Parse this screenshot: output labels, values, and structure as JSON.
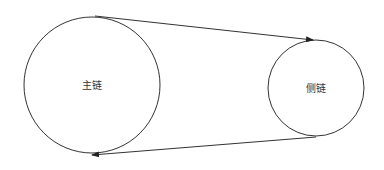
{
  "diagram": {
    "nodes": [
      {
        "id": "main-chain",
        "label": "主链",
        "cx": 92,
        "cy": 85,
        "r": 68
      },
      {
        "id": "side-chain",
        "label": "侧链",
        "cx": 316,
        "cy": 88,
        "r": 48
      }
    ],
    "edges": [
      {
        "from": "main-chain",
        "to": "side-chain",
        "x1": 95,
        "y1": 16,
        "x2": 313,
        "y2": 40
      },
      {
        "from": "side-chain",
        "to": "main-chain",
        "x1": 316,
        "y1": 137,
        "x2": 92,
        "y2": 155
      }
    ],
    "colors": {
      "stroke": "#333333",
      "text": "#333333",
      "background": "#ffffff"
    }
  }
}
